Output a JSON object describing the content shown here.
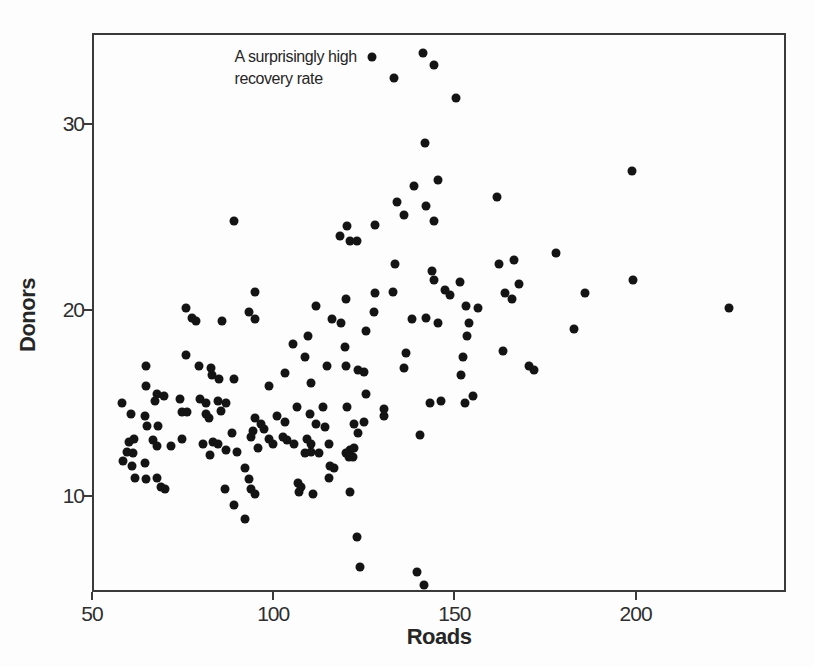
{
  "colors": {
    "dot": "#141414",
    "axis": "#3a3a3a",
    "text": "#262626",
    "background": "#fdfdfd"
  },
  "chart_data": {
    "type": "scatter",
    "title": "",
    "xlabel": "Roads",
    "ylabel": "Donors",
    "x_ticks": [
      50,
      100,
      150,
      200
    ],
    "y_ticks": [
      10,
      20,
      30
    ],
    "x_range": [
      50,
      241.5
    ],
    "y_range": [
      4.85,
      34.9
    ],
    "grid": false,
    "legend": false,
    "annotation": {
      "line1": "A surprisingly high",
      "line2": "recovery rate",
      "point": [
        127.4,
        33.6
      ]
    },
    "points": [
      [
        127.4,
        33.6
      ],
      [
        141.3,
        33.8
      ],
      [
        144.3,
        33.2
      ],
      [
        133.3,
        32.5
      ],
      [
        141.8,
        29.0
      ],
      [
        138.8,
        26.7
      ],
      [
        145.6,
        27.0
      ],
      [
        134.2,
        25.8
      ],
      [
        136.1,
        25.1
      ],
      [
        142.3,
        25.6
      ],
      [
        144.3,
        24.8
      ],
      [
        150.5,
        31.4
      ],
      [
        161.7,
        26.1
      ],
      [
        198.9,
        27.5
      ],
      [
        89.3,
        24.8
      ],
      [
        95.1,
        21.0
      ],
      [
        76.0,
        20.1
      ],
      [
        77.6,
        19.6
      ],
      [
        78.7,
        19.4
      ],
      [
        85.8,
        19.4
      ],
      [
        93.4,
        19.9
      ],
      [
        95.1,
        19.5
      ],
      [
        76.0,
        17.6
      ],
      [
        65.0,
        17.0
      ],
      [
        79.5,
        17.0
      ],
      [
        82.8,
        16.9
      ],
      [
        83.1,
        16.5
      ],
      [
        85.0,
        16.3
      ],
      [
        89.1,
        16.3
      ],
      [
        65.0,
        15.9
      ],
      [
        68.0,
        15.5
      ],
      [
        69.9,
        15.4
      ],
      [
        74.3,
        15.2
      ],
      [
        98.9,
        15.9
      ],
      [
        120.5,
        24.5
      ],
      [
        128.1,
        24.6
      ],
      [
        118.3,
        24.0
      ],
      [
        121.3,
        23.7
      ],
      [
        123.2,
        23.7
      ],
      [
        133.6,
        22.5
      ],
      [
        143.7,
        22.1
      ],
      [
        144.5,
        21.6
      ],
      [
        133.1,
        21.0
      ],
      [
        128.1,
        20.9
      ],
      [
        120.2,
        20.6
      ],
      [
        127.9,
        19.9
      ],
      [
        111.7,
        20.2
      ],
      [
        138.3,
        19.5
      ],
      [
        142.3,
        19.6
      ],
      [
        145.6,
        19.3
      ],
      [
        116.1,
        19.5
      ],
      [
        118.6,
        19.3
      ],
      [
        125.7,
        18.9
      ],
      [
        109.6,
        18.6
      ],
      [
        105.5,
        18.2
      ],
      [
        108.7,
        17.5
      ],
      [
        119.7,
        18.0
      ],
      [
        136.6,
        17.7
      ],
      [
        114.8,
        17.0
      ],
      [
        120.0,
        17.0
      ],
      [
        123.5,
        16.8
      ],
      [
        125.1,
        16.7
      ],
      [
        136.1,
        16.9
      ],
      [
        103.3,
        16.6
      ],
      [
        110.4,
        16.1
      ],
      [
        125.7,
        15.5
      ],
      [
        106.6,
        14.8
      ],
      [
        110.1,
        14.4
      ],
      [
        120.5,
        14.8
      ],
      [
        130.6,
        14.7
      ],
      [
        143.2,
        15.0
      ],
      [
        146.4,
        15.1
      ],
      [
        177.9,
        23.1
      ],
      [
        162.3,
        22.5
      ],
      [
        166.4,
        22.7
      ],
      [
        151.6,
        21.5
      ],
      [
        147.3,
        21.1
      ],
      [
        148.9,
        20.8
      ],
      [
        167.8,
        21.4
      ],
      [
        163.9,
        20.9
      ],
      [
        165.8,
        20.6
      ],
      [
        186.1,
        20.9
      ],
      [
        153.3,
        20.2
      ],
      [
        156.6,
        20.1
      ],
      [
        154.1,
        19.3
      ],
      [
        183.1,
        19.0
      ],
      [
        153.6,
        18.6
      ],
      [
        163.4,
        17.8
      ],
      [
        152.5,
        17.5
      ],
      [
        170.5,
        17.0
      ],
      [
        172.1,
        16.8
      ],
      [
        151.9,
        16.5
      ],
      [
        155.2,
        15.4
      ],
      [
        153.0,
        15.0
      ],
      [
        199.2,
        21.6
      ],
      [
        225.7,
        20.1
      ],
      [
        58.2,
        15.0
      ],
      [
        67.5,
        15.1
      ],
      [
        79.8,
        15.2
      ],
      [
        81.4,
        15.0
      ],
      [
        84.7,
        15.1
      ],
      [
        86.9,
        15.0
      ],
      [
        60.7,
        14.4
      ],
      [
        64.5,
        14.3
      ],
      [
        74.9,
        14.5
      ],
      [
        76.2,
        14.5
      ],
      [
        81.4,
        14.4
      ],
      [
        82.2,
        14.2
      ],
      [
        85.5,
        14.6
      ],
      [
        65.3,
        13.8
      ],
      [
        68.3,
        13.8
      ],
      [
        95.1,
        14.2
      ],
      [
        96.7,
        13.9
      ],
      [
        97.5,
        13.6
      ],
      [
        88.5,
        13.4
      ],
      [
        94.3,
        13.5
      ],
      [
        94.0,
        13.2
      ],
      [
        60.1,
        12.9
      ],
      [
        61.7,
        13.1
      ],
      [
        59.6,
        12.4
      ],
      [
        61.2,
        12.3
      ],
      [
        58.5,
        11.9
      ],
      [
        60.9,
        11.6
      ],
      [
        66.7,
        13.0
      ],
      [
        68.0,
        12.7
      ],
      [
        71.9,
        12.7
      ],
      [
        74.9,
        13.1
      ],
      [
        80.6,
        12.8
      ],
      [
        83.3,
        12.9
      ],
      [
        84.7,
        12.8
      ],
      [
        86.9,
        12.5
      ],
      [
        82.5,
        12.2
      ],
      [
        89.9,
        12.4
      ],
      [
        95.9,
        12.6
      ],
      [
        64.5,
        11.8
      ],
      [
        62.0,
        11.0
      ],
      [
        65.0,
        10.9
      ],
      [
        68.0,
        11.0
      ],
      [
        69.1,
        10.5
      ],
      [
        70.2,
        10.4
      ],
      [
        92.3,
        11.5
      ],
      [
        93.2,
        10.9
      ],
      [
        94.0,
        10.4
      ],
      [
        95.1,
        10.1
      ],
      [
        86.6,
        10.4
      ],
      [
        89.1,
        9.5
      ],
      [
        92.3,
        8.8
      ],
      [
        113.7,
        14.8
      ],
      [
        130.6,
        14.3
      ],
      [
        101.1,
        14.3
      ],
      [
        103.3,
        14.0
      ],
      [
        111.7,
        13.9
      ],
      [
        114.2,
        13.7
      ],
      [
        122.4,
        13.9
      ],
      [
        125.1,
        14.0
      ],
      [
        123.5,
        13.4
      ],
      [
        98.9,
        13.1
      ],
      [
        100.0,
        12.8
      ],
      [
        102.7,
        13.2
      ],
      [
        103.8,
        13.0
      ],
      [
        105.7,
        12.8
      ],
      [
        109.3,
        13.1
      ],
      [
        110.4,
        12.8
      ],
      [
        108.7,
        12.3
      ],
      [
        110.4,
        12.4
      ],
      [
        112.6,
        12.3
      ],
      [
        115.3,
        12.8
      ],
      [
        120.0,
        12.3
      ],
      [
        121.3,
        12.5
      ],
      [
        122.4,
        12.6
      ],
      [
        120.8,
        12.1
      ],
      [
        122.1,
        12.1
      ],
      [
        115.6,
        11.6
      ],
      [
        116.7,
        11.5
      ],
      [
        115.3,
        11.0
      ],
      [
        106.8,
        10.7
      ],
      [
        107.7,
        10.5
      ],
      [
        107.1,
        10.2
      ],
      [
        110.9,
        10.1
      ],
      [
        121.3,
        10.2
      ],
      [
        123.0,
        7.8
      ],
      [
        124.0,
        6.2
      ],
      [
        139.6,
        5.9
      ],
      [
        141.5,
        5.2
      ],
      [
        140.4,
        13.3
      ]
    ]
  }
}
